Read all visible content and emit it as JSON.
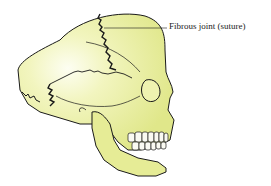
{
  "figure": {
    "labels": [
      {
        "text": "Fibrous joint (suture)",
        "target": "coronal-suture"
      }
    ]
  },
  "colors": {
    "bone_fill": "#e6ec96",
    "bone_highlight": "#fbfde8",
    "outline": "#1a1a1a",
    "background": "#ffffff"
  }
}
